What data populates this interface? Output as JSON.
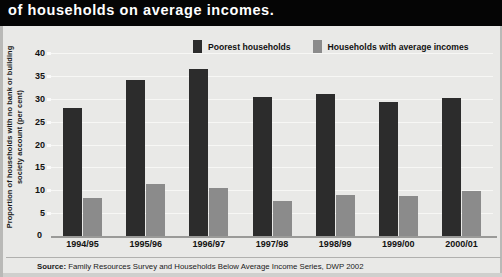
{
  "headline": "of households on average incomes.",
  "colors": {
    "poorest": "#2c2c2c",
    "average": "#8b8b8b",
    "panel_bg": "#e9e9e7",
    "band_bg": "#050505",
    "grid": "#f7f7f5"
  },
  "legend": {
    "items": [
      {
        "label": "Poorest households",
        "swatch": "#2c2c2c",
        "icon": "legend-swatch-dark"
      },
      {
        "label": "Households with average incomes",
        "swatch": "#8b8b8b",
        "icon": "legend-swatch-light"
      }
    ]
  },
  "source": {
    "prefix": "Source:",
    "text": "Family Resources Survey and Households Below Average Income Series, DWP 2002"
  },
  "chart_data": {
    "type": "bar",
    "title": "of households on average incomes.",
    "subtitle": "",
    "xlabel": "",
    "ylabel": "Proportion of households with no bank or building society account (per cent)",
    "ylim": [
      0,
      40
    ],
    "yticks": [
      0,
      5,
      10,
      15,
      20,
      25,
      30,
      35,
      40
    ],
    "ytick_labels": [
      "0",
      "5",
      "10",
      "15",
      "20",
      "25",
      "30",
      "35",
      "40"
    ],
    "grid": true,
    "legend_position": "top-center",
    "categories": [
      "1994/95",
      "1995/96",
      "1996/97",
      "1997/98",
      "1998/99",
      "1999/00",
      "2000/01"
    ],
    "series": [
      {
        "name": "Poorest households",
        "color": "#2c2c2c",
        "values": [
          28,
          34,
          36.5,
          30.3,
          31,
          29.3,
          30.2
        ]
      },
      {
        "name": "Households with average incomes",
        "color": "#8b8b8b",
        "values": [
          8.3,
          11.4,
          10.4,
          7.6,
          9,
          8.8,
          9.8
        ]
      }
    ]
  }
}
